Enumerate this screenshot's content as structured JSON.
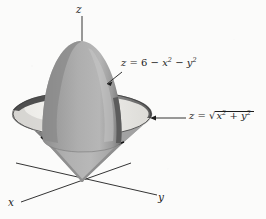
{
  "figure": {
    "background_color": "#fbfbfa",
    "ink_color": "#1d1d1d",
    "axes": {
      "z_label": "z",
      "x_label": "x",
      "y_label": "y",
      "origin": [
        82,
        182
      ]
    },
    "labels": {
      "paraboloid": {
        "z": "z",
        "equals": "=",
        "constant": "6",
        "minus1": "−",
        "x": "x",
        "exp_x": "2",
        "minus2": "−",
        "y": "y",
        "exp_y": "2",
        "full_text": "z = 6 − x² − y²"
      },
      "cone": {
        "z": "z",
        "equals": "=",
        "x": "x",
        "exp_x": "2",
        "plus": "+",
        "y": "y",
        "exp_y": "2",
        "full_text": "z = √(x² + y²)"
      }
    },
    "surfaces": [
      {
        "name": "paraboloid",
        "equation": "z = 6 - x^2 - y^2",
        "shading": "gray dome, dark left, light right",
        "colors": {
          "dark": "#7d7d7d",
          "mid": "#9d9d9d",
          "light": "#c2c2c2"
        }
      },
      {
        "name": "cone",
        "equation": "z = sqrt(x^2 + y^2)",
        "shading": "gray funnel opening upward from origin",
        "colors": {
          "dark": "#6f6f6f",
          "mid": "#a5a5a5",
          "light": "#f0efec"
        }
      },
      {
        "name": "intersection-curve",
        "description": "circle where paraboloid meets cone",
        "color": "#141414"
      }
    ]
  }
}
